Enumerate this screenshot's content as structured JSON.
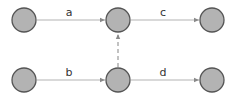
{
  "diagram": {
    "type": "directed-graph",
    "colors": {
      "node_fill": "#b3b3b3",
      "node_stroke": "#555555",
      "edge": "#b4b4b4"
    },
    "nodes": [
      {
        "id": "n1",
        "row": "top",
        "col": 1
      },
      {
        "id": "n2",
        "row": "top",
        "col": 2
      },
      {
        "id": "n3",
        "row": "top",
        "col": 3
      },
      {
        "id": "n4",
        "row": "bottom",
        "col": 1
      },
      {
        "id": "n5",
        "row": "bottom",
        "col": 2
      },
      {
        "id": "n6",
        "row": "bottom",
        "col": 3
      }
    ],
    "edges": [
      {
        "from": "n1",
        "to": "n2",
        "label": "a",
        "style": "solid"
      },
      {
        "from": "n4",
        "to": "n5",
        "label": "b",
        "style": "solid"
      },
      {
        "from": "n2",
        "to": "n3",
        "label": "c",
        "style": "solid"
      },
      {
        "from": "n5",
        "to": "n6",
        "label": "d",
        "style": "solid"
      },
      {
        "from": "n5",
        "to": "n2",
        "label": "",
        "style": "dashed"
      }
    ],
    "labels": {
      "a": "a",
      "b": "b",
      "c": "c",
      "d": "d"
    }
  }
}
